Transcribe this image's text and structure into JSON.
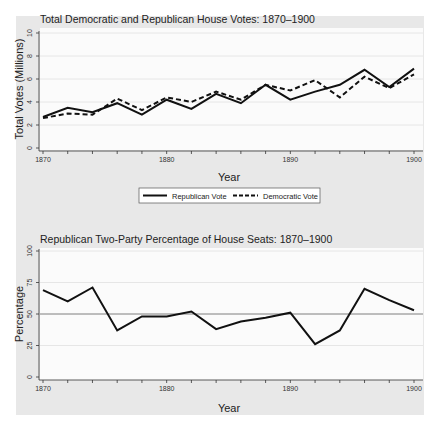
{
  "chart_data": [
    {
      "type": "line",
      "title": "Total Democratic and Republican House Votes: 1870–1900",
      "xlabel": "Year",
      "ylabel": "Total Votes (Millions)",
      "xlim": [
        1870,
        1900
      ],
      "ylim": [
        0,
        10
      ],
      "x_ticks": [
        1870,
        1880,
        1890,
        1900
      ],
      "y_ticks": [
        0,
        2,
        4,
        6,
        8,
        10
      ],
      "grid": true,
      "legend_position": "bottom",
      "x": [
        1870,
        1872,
        1874,
        1876,
        1878,
        1880,
        1882,
        1884,
        1886,
        1888,
        1890,
        1892,
        1894,
        1896,
        1898,
        1900
      ],
      "series": [
        {
          "name": "Republican Vote",
          "style": "solid",
          "values": [
            2.7,
            3.5,
            3.1,
            3.9,
            2.9,
            4.2,
            3.4,
            4.7,
            3.9,
            5.5,
            4.2,
            4.9,
            5.5,
            6.8,
            5.3,
            6.9
          ]
        },
        {
          "name": "Democratic Vote",
          "style": "dashed",
          "values": [
            2.6,
            3.0,
            2.9,
            4.3,
            3.3,
            4.4,
            4.0,
            4.9,
            4.2,
            5.5,
            5.0,
            5.9,
            4.4,
            6.2,
            5.2,
            6.4
          ]
        }
      ]
    },
    {
      "type": "line",
      "title": "Republican Two-Party Percentage of House Seats: 1870–1900",
      "xlabel": "Year",
      "ylabel": "Percentage",
      "xlim": [
        1870,
        1900
      ],
      "ylim": [
        0,
        100
      ],
      "x_ticks": [
        1870,
        1880,
        1890,
        1900
      ],
      "y_ticks": [
        0,
        25,
        50,
        75,
        100
      ],
      "grid": true,
      "reference_line": 50,
      "x": [
        1870,
        1872,
        1874,
        1876,
        1878,
        1880,
        1882,
        1884,
        1886,
        1888,
        1890,
        1892,
        1894,
        1896,
        1898,
        1900
      ],
      "series": [
        {
          "name": "Republican Percentage",
          "style": "solid",
          "values": [
            69,
            60,
            71,
            37,
            48,
            48,
            52,
            38,
            44,
            47,
            51,
            26,
            37,
            70,
            61,
            53
          ]
        }
      ]
    }
  ]
}
